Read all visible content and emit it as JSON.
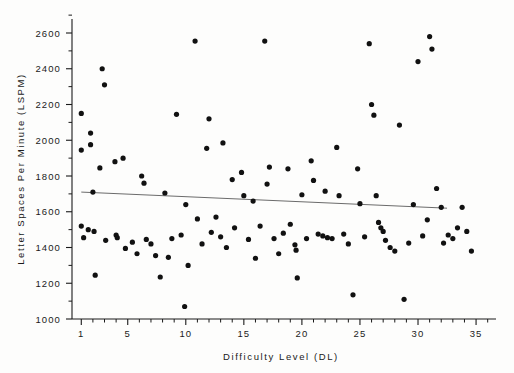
{
  "chart_data": {
    "type": "scatter",
    "title": "",
    "xlabel": "Difficulty Level (DL)",
    "ylabel": "Letter Spaces Per Minute (LSPM)",
    "xlim": [
      0.2,
      36.2
    ],
    "ylim": [
      1000,
      2680
    ],
    "grid": false,
    "legend": null,
    "x_ticks_major": [
      1,
      5,
      10,
      15,
      20,
      25,
      30,
      35
    ],
    "x_tick_labels": [
      "1",
      "5",
      "10",
      "15",
      "20",
      "25",
      "30",
      "35"
    ],
    "x_ticks_minor": [
      2,
      3,
      4,
      6,
      7,
      8,
      9,
      11,
      12,
      13,
      14,
      16,
      17,
      18,
      19,
      21,
      22,
      23,
      24,
      26,
      27,
      28,
      29,
      31,
      32,
      33,
      34,
      36
    ],
    "y_ticks_major": [
      1000,
      1200,
      1400,
      1600,
      1800,
      2000,
      2200,
      2400,
      2600
    ],
    "y_tick_labels": [
      "1000",
      "1200",
      "1400",
      "1600",
      "1800",
      "2000",
      "2200",
      "2400",
      "2600"
    ],
    "y_ticks_minor": [
      1100,
      1300,
      1500,
      1700,
      1900,
      2100,
      2300,
      2500
    ],
    "point_color": "#111111",
    "point_radius": 2.6,
    "trendline": {
      "label": "least-squares fit",
      "color": "#6b6b6b",
      "x_start": 1,
      "y_start": 1710,
      "x_end": 32.5,
      "y_end": 1620
    },
    "points": [
      {
        "x": 1.0,
        "y": 2150
      },
      {
        "x": 1.0,
        "y": 1945
      },
      {
        "x": 1.0,
        "y": 1520
      },
      {
        "x": 1.2,
        "y": 1455
      },
      {
        "x": 1.6,
        "y": 1500
      },
      {
        "x": 1.8,
        "y": 2040
      },
      {
        "x": 1.8,
        "y": 1975
      },
      {
        "x": 2.0,
        "y": 1710
      },
      {
        "x": 2.1,
        "y": 1490
      },
      {
        "x": 2.2,
        "y": 1245
      },
      {
        "x": 2.6,
        "y": 1845
      },
      {
        "x": 2.8,
        "y": 2400
      },
      {
        "x": 3.0,
        "y": 2310
      },
      {
        "x": 3.1,
        "y": 1440
      },
      {
        "x": 3.9,
        "y": 1880
      },
      {
        "x": 4.0,
        "y": 1470
      },
      {
        "x": 4.1,
        "y": 1455
      },
      {
        "x": 4.6,
        "y": 1900
      },
      {
        "x": 4.8,
        "y": 1395
      },
      {
        "x": 5.4,
        "y": 1430
      },
      {
        "x": 5.8,
        "y": 1365
      },
      {
        "x": 6.2,
        "y": 1800
      },
      {
        "x": 6.4,
        "y": 1760
      },
      {
        "x": 6.6,
        "y": 1445
      },
      {
        "x": 7.0,
        "y": 1420
      },
      {
        "x": 7.4,
        "y": 1355
      },
      {
        "x": 7.8,
        "y": 1235
      },
      {
        "x": 8.2,
        "y": 1705
      },
      {
        "x": 8.5,
        "y": 1345
      },
      {
        "x": 8.8,
        "y": 1450
      },
      {
        "x": 9.2,
        "y": 2145
      },
      {
        "x": 9.6,
        "y": 1470
      },
      {
        "x": 9.9,
        "y": 1070
      },
      {
        "x": 10.0,
        "y": 1640
      },
      {
        "x": 10.2,
        "y": 1300
      },
      {
        "x": 10.8,
        "y": 2555
      },
      {
        "x": 11.0,
        "y": 1560
      },
      {
        "x": 11.4,
        "y": 1420
      },
      {
        "x": 11.8,
        "y": 1955
      },
      {
        "x": 12.0,
        "y": 2120
      },
      {
        "x": 12.2,
        "y": 1485
      },
      {
        "x": 12.6,
        "y": 1570
      },
      {
        "x": 13.0,
        "y": 1460
      },
      {
        "x": 13.2,
        "y": 1985
      },
      {
        "x": 13.5,
        "y": 1400
      },
      {
        "x": 14.0,
        "y": 1780
      },
      {
        "x": 14.2,
        "y": 1510
      },
      {
        "x": 14.8,
        "y": 1820
      },
      {
        "x": 15.0,
        "y": 1690
      },
      {
        "x": 15.4,
        "y": 1445
      },
      {
        "x": 15.8,
        "y": 1660
      },
      {
        "x": 16.0,
        "y": 1340
      },
      {
        "x": 16.4,
        "y": 1520
      },
      {
        "x": 16.8,
        "y": 2555
      },
      {
        "x": 17.0,
        "y": 1755
      },
      {
        "x": 17.2,
        "y": 1850
      },
      {
        "x": 17.6,
        "y": 1450
      },
      {
        "x": 18.0,
        "y": 1365
      },
      {
        "x": 18.4,
        "y": 1480
      },
      {
        "x": 18.8,
        "y": 1840
      },
      {
        "x": 19.0,
        "y": 1530
      },
      {
        "x": 19.4,
        "y": 1415
      },
      {
        "x": 19.5,
        "y": 1385
      },
      {
        "x": 19.6,
        "y": 1230
      },
      {
        "x": 20.0,
        "y": 1695
      },
      {
        "x": 20.4,
        "y": 1450
      },
      {
        "x": 20.8,
        "y": 1885
      },
      {
        "x": 21.0,
        "y": 1775
      },
      {
        "x": 21.4,
        "y": 1475
      },
      {
        "x": 21.8,
        "y": 1465
      },
      {
        "x": 22.0,
        "y": 1715
      },
      {
        "x": 22.2,
        "y": 1455
      },
      {
        "x": 22.6,
        "y": 1450
      },
      {
        "x": 23.0,
        "y": 1960
      },
      {
        "x": 23.2,
        "y": 1690
      },
      {
        "x": 23.6,
        "y": 1475
      },
      {
        "x": 24.0,
        "y": 1420
      },
      {
        "x": 24.4,
        "y": 1135
      },
      {
        "x": 24.8,
        "y": 1840
      },
      {
        "x": 25.0,
        "y": 1645
      },
      {
        "x": 25.4,
        "y": 1460
      },
      {
        "x": 25.8,
        "y": 2540
      },
      {
        "x": 26.0,
        "y": 2200
      },
      {
        "x": 26.2,
        "y": 2140
      },
      {
        "x": 26.4,
        "y": 1690
      },
      {
        "x": 26.6,
        "y": 1540
      },
      {
        "x": 26.8,
        "y": 1510
      },
      {
        "x": 27.0,
        "y": 1490
      },
      {
        "x": 27.2,
        "y": 1440
      },
      {
        "x": 27.6,
        "y": 1400
      },
      {
        "x": 28.0,
        "y": 1380
      },
      {
        "x": 28.4,
        "y": 2085
      },
      {
        "x": 28.8,
        "y": 1110
      },
      {
        "x": 29.2,
        "y": 1425
      },
      {
        "x": 29.6,
        "y": 1640
      },
      {
        "x": 30.0,
        "y": 2440
      },
      {
        "x": 30.4,
        "y": 1465
      },
      {
        "x": 30.8,
        "y": 1555
      },
      {
        "x": 31.0,
        "y": 2580
      },
      {
        "x": 31.2,
        "y": 2510
      },
      {
        "x": 31.6,
        "y": 1730
      },
      {
        "x": 32.0,
        "y": 1625
      },
      {
        "x": 32.2,
        "y": 1425
      },
      {
        "x": 32.6,
        "y": 1470
      },
      {
        "x": 33.0,
        "y": 1450
      },
      {
        "x": 33.4,
        "y": 1510
      },
      {
        "x": 33.8,
        "y": 1625
      },
      {
        "x": 34.2,
        "y": 1490
      },
      {
        "x": 34.6,
        "y": 1380
      }
    ]
  }
}
